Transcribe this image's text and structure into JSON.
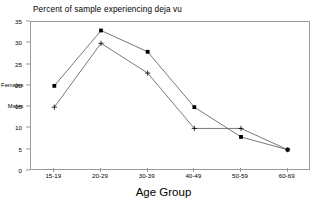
{
  "chart_data": {
    "type": "line",
    "title": "Percent of sample experiencing deja vu",
    "xlabel": "Age Group",
    "ylabel": "",
    "categories": [
      "15-19",
      "20-29",
      "30-39",
      "40-49",
      "50-59",
      "60-69"
    ],
    "series": [
      {
        "name": "Females",
        "marker": "filled-square",
        "values": [
          20,
          33,
          28,
          15,
          8,
          5
        ]
      },
      {
        "name": "Males",
        "marker": "plus",
        "values": [
          15,
          30,
          23,
          10,
          10,
          5
        ]
      }
    ],
    "ylim": [
      0,
      35
    ],
    "yticks": [
      0,
      5,
      10,
      15,
      20,
      25,
      30,
      35
    ],
    "ytick_labels": [
      "0",
      "5",
      "10",
      "15",
      "20",
      "25",
      "30",
      "35"
    ],
    "grid": false,
    "legend": "inline-labels",
    "line_color": "#555555",
    "frame_color": "#9a9a9a",
    "background": "#ffffff"
  },
  "labels": {
    "females": "Females",
    "males": "Males"
  }
}
